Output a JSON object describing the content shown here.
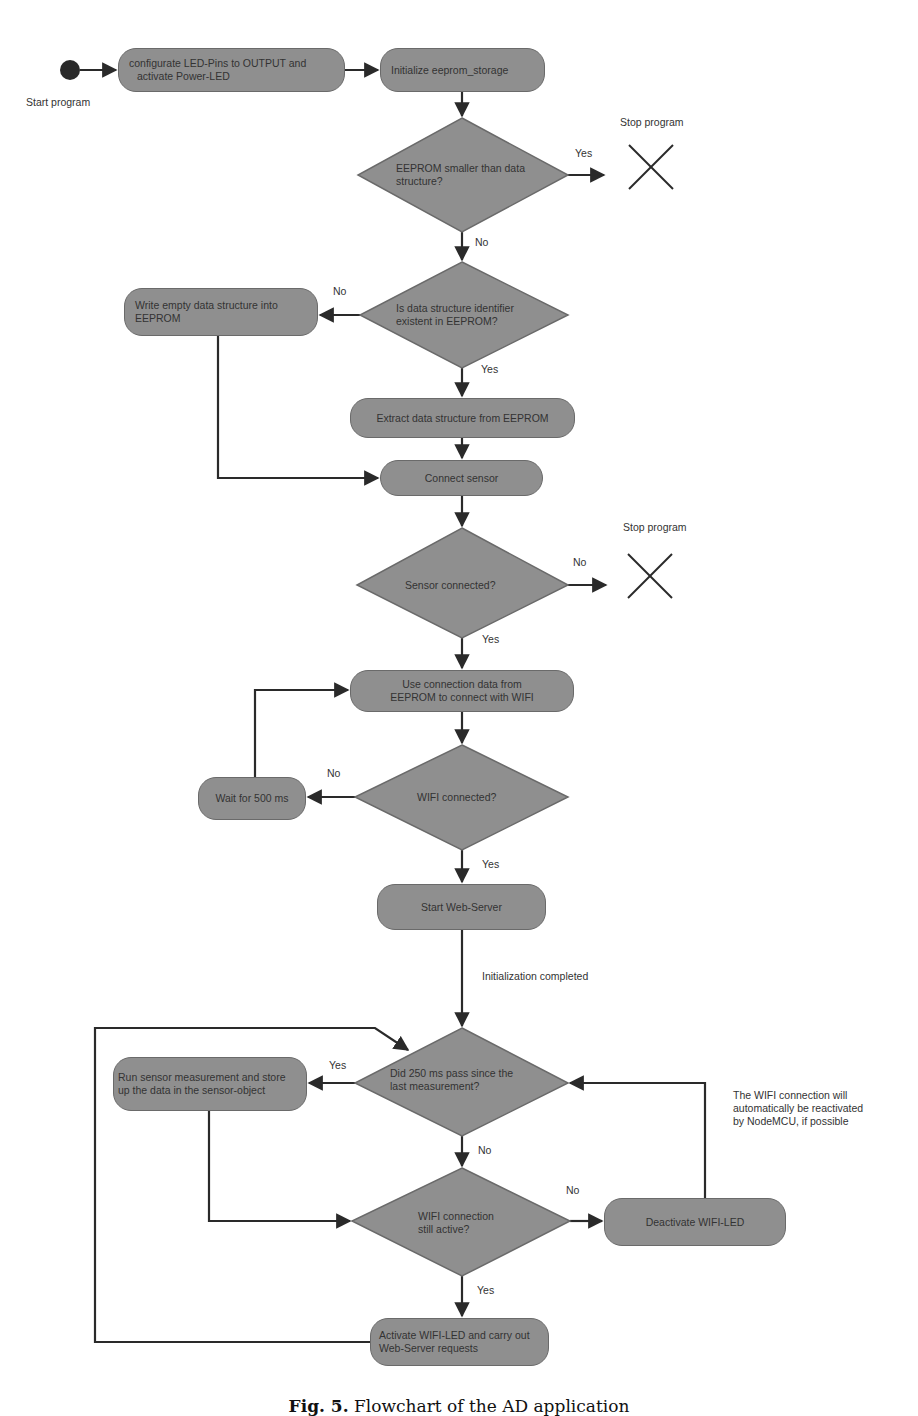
{
  "diagram": {
    "type": "flowchart",
    "start": {
      "label": "Start program"
    },
    "nodes": {
      "configure_leds": "configurate LED-Pins to OUTPUT and activate Power-LED",
      "configure_leds_line1": "configurate LED-Pins to OUTPUT and",
      "configure_leds_line2": "activate Power-LED",
      "init_eeprom": "Initialize eeprom_storage",
      "decision_eeprom_size_line1": "EEPROM smaller than data",
      "decision_eeprom_size_line2": "structure?",
      "stop1": "Stop program",
      "decision_identifier_line1": "Is data structure identifier",
      "decision_identifier_line2": "existent in EEPROM?",
      "write_empty_line1": "Write empty data structure into",
      "write_empty_line2": "EEPROM",
      "extract": "Extract data structure from EEPROM",
      "connect_sensor": "Connect sensor",
      "decision_sensor": "Sensor connected?",
      "stop2": "Stop program",
      "use_connection_line1": "Use connection data from",
      "use_connection_line2": "EEPROM to connect with WIFI",
      "decision_wifi": "WIFI connected?",
      "wait": "Wait for 500 ms",
      "start_webserver": "Start Web-Server",
      "init_completed": "Initialization completed",
      "decision_250_line1": "Did 250 ms pass since the",
      "decision_250_line2": "last measurement?",
      "run_sensor_line1": "Run sensor measurement and store",
      "run_sensor_line2": "up the data in the sensor-object",
      "decision_wifi_active_line1": "WIFI connection",
      "decision_wifi_active_line2": "still active?",
      "deactivate_led": "Deactivate WIFI-LED",
      "activate_led_line1": "Activate WIFI-LED and carry out",
      "activate_led_line2": "Web-Server requests",
      "note_line1": "The WIFI connection will",
      "note_line2": "automatically be reactivated",
      "note_line3": "by NodeMCU, if possible"
    },
    "edge_labels": {
      "d1_yes": "Yes",
      "d1_no": "No",
      "d2_no": "No",
      "d2_yes": "Yes",
      "d3_no": "No",
      "d3_yes": "Yes",
      "d4_no": "No",
      "d4_yes": "Yes",
      "d5_yes": "Yes",
      "d5_no": "No",
      "d6_no": "No",
      "d6_yes": "Yes"
    },
    "colors": {
      "node_fill": "#8f8f8f",
      "node_border": "#6a6a6a",
      "edge": "#2a2a2a",
      "background": "#ffffff"
    },
    "caption": {
      "prefix": "Fig. 5.",
      "text": "Flowchart of the AD application"
    }
  }
}
